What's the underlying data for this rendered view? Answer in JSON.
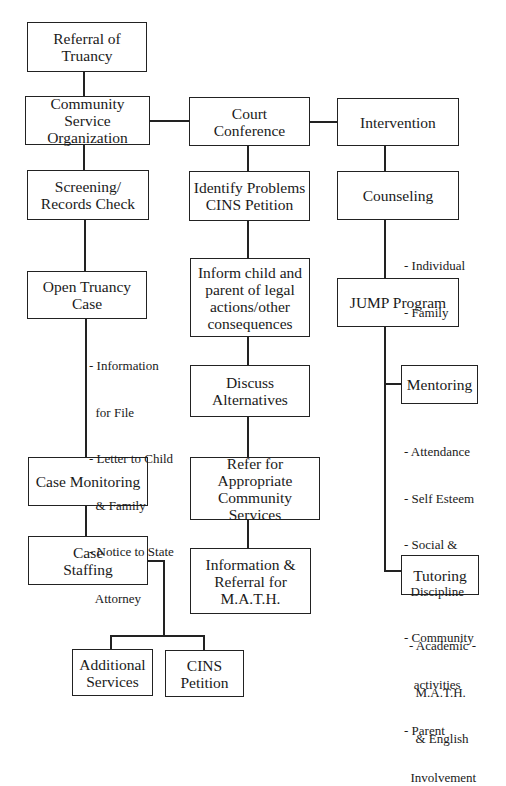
{
  "diagram": {
    "type": "flowchart",
    "boxes": {
      "referral": "Referral of\nTruancy",
      "cso": "Community Service\nOrganization",
      "court": "Court\nConference",
      "intervention": "Intervention",
      "screening": "Screening/\nRecords Check",
      "identify": "Identify Problems\nCINS Petition",
      "counseling": "Counseling",
      "open_case": "Open Truancy\nCase",
      "inform": "Inform child and\nparent of legal\nactions/other\nconsequences",
      "jump": "JUMP Program",
      "discuss": "Discuss\nAlternatives",
      "mentoring": "Mentoring",
      "case_monitoring": "Case Monitoring",
      "refer": "Refer for\nAppropriate\nCommunity Services",
      "case_staffing": "Case\nStaffing",
      "info_referral": "Information &\nReferral for\nM.A.T.H.",
      "tutoring": "Tutoring",
      "additional": "Additional\nServices",
      "cins": "CINS\nPetition"
    },
    "notes": {
      "counseling": [
        "- Individual",
        "- Family"
      ],
      "open_case": [
        "- Information",
        "  for File",
        "- Letter to Child",
        "  & Family",
        "- Notice to State",
        "  Attorney"
      ],
      "mentoring": [
        "- Attendance",
        "- Self Esteem",
        "- Social &",
        "  Discipline",
        "- Community",
        "   activities",
        "- Parent",
        "  Involvement"
      ],
      "tutoring": [
        "- Academic -",
        "  M.A.T.H.",
        "  & English"
      ]
    }
  }
}
